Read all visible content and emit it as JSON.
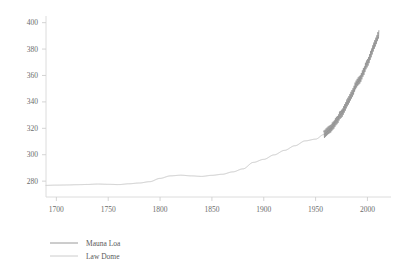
{
  "chart_data": {
    "type": "line",
    "title": "",
    "subtitle": "",
    "xlabel": "",
    "ylabel": "",
    "xlim": [
      1690,
      2015
    ],
    "ylim": [
      268,
      402
    ],
    "grid": false,
    "legend_position": "bottom-left",
    "xticks": [
      1700,
      1750,
      1800,
      1850,
      1900,
      1950,
      2000
    ],
    "xtick_labels": [
      "1700",
      "1750",
      "1800",
      "1850",
      "1900",
      "1950",
      "2000"
    ],
    "yticks": [
      280,
      300,
      320,
      340,
      360,
      380,
      400
    ],
    "ytick_labels": [
      "280",
      "300",
      "320",
      "340",
      "360",
      "380",
      "400"
    ],
    "series": [
      {
        "name": "Mauna Loa",
        "color": "#8e8e8e",
        "x": [
          1958,
          1959,
          1960,
          1961,
          1962,
          1963,
          1964,
          1965,
          1966,
          1967,
          1968,
          1969,
          1970,
          1971,
          1972,
          1973,
          1974,
          1975,
          1976,
          1977,
          1978,
          1979,
          1980,
          1981,
          1982,
          1983,
          1984,
          1985,
          1986,
          1987,
          1988,
          1989,
          1990,
          1991,
          1992,
          1993,
          1994,
          1995,
          1996,
          1997,
          1998,
          1999,
          2000,
          2001,
          2002,
          2003,
          2004,
          2005,
          2006,
          2007,
          2008,
          2009,
          2010,
          2011
        ],
        "values": [
          315.3,
          315.9,
          316.9,
          317.6,
          318.4,
          318.9,
          319.5,
          320.0,
          321.4,
          322.2,
          323.0,
          324.6,
          325.7,
          326.3,
          327.5,
          329.7,
          330.2,
          331.1,
          332.0,
          333.8,
          335.4,
          336.8,
          338.8,
          340.1,
          341.4,
          343.0,
          344.6,
          346.0,
          347.4,
          349.2,
          351.6,
          353.1,
          354.4,
          355.6,
          356.4,
          357.1,
          358.8,
          360.8,
          362.6,
          363.8,
          366.6,
          368.3,
          369.5,
          371.0,
          373.1,
          375.6,
          377.4,
          379.8,
          381.9,
          383.8,
          385.6,
          387.4,
          389.9,
          391.6
        ],
        "seasonal_amplitude": 3.0,
        "style": "solid"
      },
      {
        "name": "Law Dome",
        "color": "#c9c9c9",
        "x": [
          1690,
          1700,
          1710,
          1720,
          1730,
          1740,
          1750,
          1760,
          1770,
          1780,
          1790,
          1800,
          1810,
          1820,
          1830,
          1840,
          1850,
          1860,
          1870,
          1880,
          1890,
          1900,
          1910,
          1920,
          1930,
          1940,
          1950,
          1958,
          1965,
          1970,
          1975,
          1980,
          1985,
          1990,
          1995,
          2000,
          2005,
          2008
        ],
        "values": [
          276.8,
          277.0,
          277.1,
          277.3,
          277.5,
          277.8,
          277.6,
          277.4,
          278.0,
          278.6,
          279.6,
          282.1,
          284.0,
          284.5,
          284.0,
          283.6,
          284.4,
          285.2,
          287.0,
          289.3,
          294.2,
          296.5,
          299.9,
          303.3,
          306.8,
          310.5,
          311.8,
          315.3,
          320.0,
          325.7,
          331.1,
          338.8,
          346.0,
          354.4,
          360.8,
          369.5,
          379.8,
          385.6
        ],
        "seasonal_amplitude": 0,
        "style": "solid"
      }
    ],
    "legend": [
      {
        "label": "Mauna Loa",
        "color": "#9a9a9a"
      },
      {
        "label": "Law Dome",
        "color": "#cccccc"
      }
    ],
    "axis_color": "#d8d8d8",
    "tick_color": "#cfcfcf",
    "background": "#ffffff"
  }
}
